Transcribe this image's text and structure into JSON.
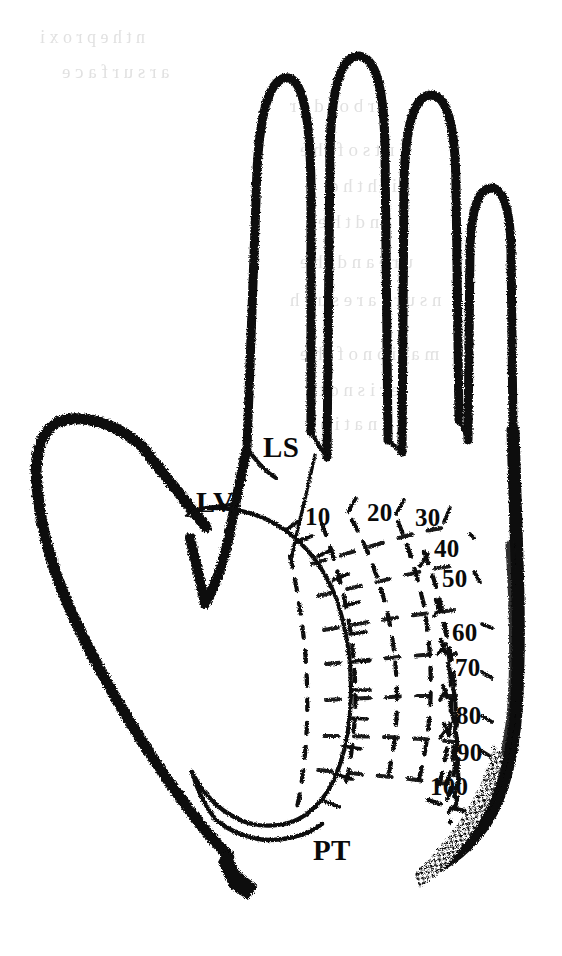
{
  "figure": {
    "kind": "anatomical-line-drawing",
    "background_color": "#ffffff",
    "ink_color": "#0a0a0a",
    "width": 562,
    "height": 956
  },
  "region_labels": [
    {
      "id": "LS",
      "text": "LS",
      "x": 263,
      "y": 433
    },
    {
      "id": "LV",
      "text": "LV",
      "x": 196,
      "y": 488
    },
    {
      "id": "PT",
      "text": "PT",
      "x": 313,
      "y": 836
    }
  ],
  "contour_labels": [
    {
      "value": "10",
      "x": 305,
      "y": 504
    },
    {
      "value": "20",
      "x": 367,
      "y": 500
    },
    {
      "value": "30",
      "x": 415,
      "y": 505
    },
    {
      "value": "40",
      "x": 434,
      "y": 536
    },
    {
      "value": "50",
      "x": 442,
      "y": 566
    },
    {
      "value": "60",
      "x": 452,
      "y": 620
    },
    {
      "value": "70",
      "x": 455,
      "y": 655
    },
    {
      "value": "80",
      "x": 456,
      "y": 703
    },
    {
      "value": "90",
      "x": 457,
      "y": 740
    },
    {
      "value": "100",
      "x": 430,
      "y": 774
    }
  ],
  "legend_keys": {
    "LS": "LS",
    "LV": "LV",
    "PT": "PT"
  },
  "ghost_text": {
    "note": "faint mirrored bleed-through from reverse of printed page; illegible",
    "lines": [
      {
        "text": "n  t  h  e     p  r  o  x  i",
        "x": 40,
        "y": 28,
        "size": 18
      },
      {
        "text": "a  r     s  u  r  f  a  c  e",
        "x": 62,
        "y": 62,
        "size": 19
      },
      {
        "text": "e  r     b  o  r  d  e  r",
        "x": 290,
        "y": 96,
        "size": 19
      },
      {
        "text": "e  n  t     s  o  f     t  h  e",
        "x": 300,
        "y": 140,
        "size": 19
      },
      {
        "text": "i  t  h     t  h  e",
        "x": 330,
        "y": 176,
        "size": 19
      },
      {
        "text": "a  n  d     t  h  e",
        "x": 318,
        "y": 212,
        "size": 19
      },
      {
        "text": "u  r  e     a  n  d     t  h  e",
        "x": 300,
        "y": 252,
        "size": 19
      },
      {
        "text": "n  s  u  r  e     a  r  e     s  u  c  h",
        "x": 290,
        "y": 290,
        "size": 19
      },
      {
        "text": "m  a  t  i  o  n     o  f     t  h  e",
        "x": 300,
        "y": 344,
        "size": 19
      },
      {
        "text": "e  r     i  s     n  o  t     a",
        "x": 306,
        "y": 380,
        "size": 19
      },
      {
        "text": "i  n  a  t  i  o  n",
        "x": 306,
        "y": 414,
        "size": 19
      }
    ]
  }
}
